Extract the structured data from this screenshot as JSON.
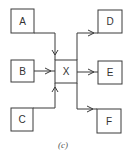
{
  "diagram": {
    "caption": "(c)",
    "nodes": [
      {
        "id": "A",
        "label": "A"
      },
      {
        "id": "B",
        "label": "B"
      },
      {
        "id": "C",
        "label": "C"
      },
      {
        "id": "X",
        "label": "X"
      },
      {
        "id": "D",
        "label": "D"
      },
      {
        "id": "E",
        "label": "E"
      },
      {
        "id": "F",
        "label": "F"
      }
    ],
    "edges": [
      {
        "from": "A",
        "to": "X"
      },
      {
        "from": "B",
        "to": "X"
      },
      {
        "from": "C",
        "to": "X"
      },
      {
        "from": "X",
        "to": "D"
      },
      {
        "from": "X",
        "to": "E"
      },
      {
        "from": "X",
        "to": "F"
      }
    ],
    "colors": {
      "stroke": "#3a3a3a",
      "text": "#333333",
      "background": "#ffffff"
    }
  }
}
